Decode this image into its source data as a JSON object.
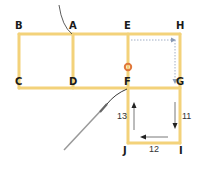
{
  "diagram": {
    "colors": {
      "edge": "#f3d27a",
      "marker": "#e0783a",
      "dotted_arrow": "#8a9ab5",
      "solid_arrow": "#555555",
      "label": "#1a1a1a"
    },
    "points": [
      {
        "id": "B",
        "label": "B"
      },
      {
        "id": "A",
        "label": "A"
      },
      {
        "id": "E",
        "label": "E"
      },
      {
        "id": "H",
        "label": "H"
      },
      {
        "id": "C",
        "label": "C"
      },
      {
        "id": "D",
        "label": "D"
      },
      {
        "id": "F",
        "label": "F"
      },
      {
        "id": "G",
        "label": "G"
      },
      {
        "id": "J",
        "label": "J"
      },
      {
        "id": "I",
        "label": "I"
      }
    ],
    "step_numbers": {
      "right_side": "11",
      "bottom_side": "12",
      "left_side": "13"
    }
  }
}
